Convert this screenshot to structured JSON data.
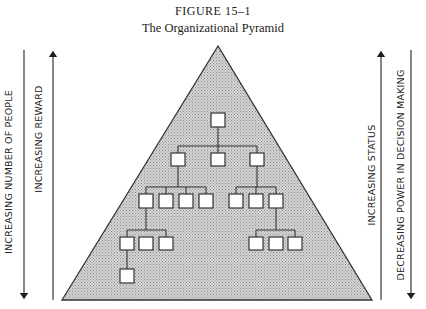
{
  "figure": {
    "number": "FIGURE 15–1",
    "caption": "The Organizational Pyramid"
  },
  "arrows": {
    "left_outer": {
      "label": "INCREASING NUMBER OF PEOPLE",
      "direction": "down"
    },
    "left_inner": {
      "label": "INCREASING REWARD",
      "direction": "up"
    },
    "right_inner": {
      "label": "INCREASING STATUS",
      "direction": "up"
    },
    "right_outer": {
      "label": "DECREASING POWER IN DECISION MAKING",
      "direction": "down"
    }
  },
  "pyramid": {
    "fill": "#c8c8c8",
    "stroke": "#333333",
    "levels": [
      {
        "level": 1,
        "boxes": 1
      },
      {
        "level": 2,
        "boxes": 3
      },
      {
        "level": 3,
        "boxes": 7
      },
      {
        "level": 4,
        "boxes": 6
      },
      {
        "level": 5,
        "boxes": 1
      }
    ]
  }
}
